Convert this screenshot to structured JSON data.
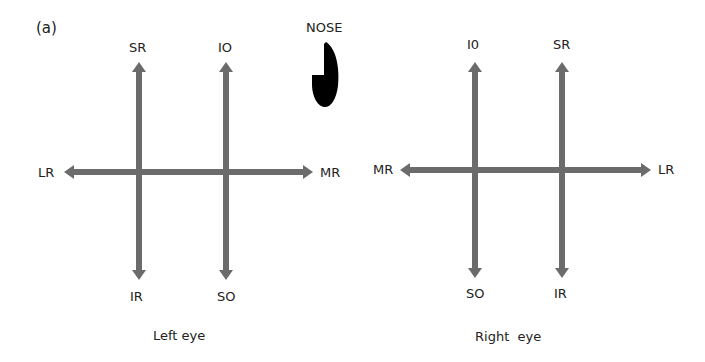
{
  "figure": {
    "panel_label": "(a)",
    "nose_label": "NOSE",
    "arrow_color": "#6b6b6b",
    "nose_color": "#000000"
  },
  "left_eye": {
    "caption": "Left eye",
    "labels": {
      "top_left": "SR",
      "top_right": "IO",
      "bottom_left": "IR",
      "bottom_right": "SO",
      "left": "LR",
      "right": "MR"
    }
  },
  "right_eye": {
    "caption": "Right  eye",
    "labels": {
      "top_left": "I0",
      "top_right": "SR",
      "bottom_left": "SO",
      "bottom_right": "IR",
      "left": "MR",
      "right": "LR"
    }
  }
}
